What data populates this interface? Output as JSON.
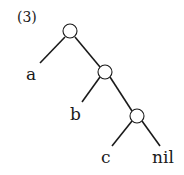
{
  "diagram": {
    "type": "binary-tree",
    "label": "(3)",
    "nodes": [
      {
        "id": "root",
        "kind": "internal"
      },
      {
        "id": "n2",
        "kind": "internal"
      },
      {
        "id": "n3",
        "kind": "internal"
      }
    ],
    "leaves": {
      "a": "a",
      "b": "b",
      "c": "c",
      "nil": "nil"
    },
    "edges": [
      [
        "root",
        "a"
      ],
      [
        "root",
        "n2"
      ],
      [
        "n2",
        "b"
      ],
      [
        "n2",
        "n3"
      ],
      [
        "n3",
        "c"
      ],
      [
        "n3",
        "nil"
      ]
    ]
  }
}
